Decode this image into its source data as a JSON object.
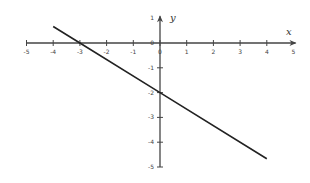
{
  "chart_data": {
    "type": "line",
    "title": "",
    "xlabel": "x",
    "ylabel": "y",
    "xlim": [
      -5,
      5
    ],
    "ylim": [
      -5,
      1
    ],
    "x_ticks": [
      -5,
      -4,
      -3,
      -2,
      -1,
      0,
      1,
      2,
      3,
      4,
      5
    ],
    "y_ticks": [
      1,
      0,
      -1,
      -2,
      -3,
      -4,
      -5
    ],
    "grid": false,
    "legend": null,
    "series": [
      {
        "name": "y = -2/3 x - 2",
        "x": [
          -4,
          -3,
          0,
          4
        ],
        "y": [
          0.667,
          0,
          -2,
          -4.667
        ]
      }
    ],
    "colors": {
      "line": "#222222",
      "axis": "#444444"
    }
  },
  "labels": {
    "x_axis": "x",
    "y_axis": "y",
    "x_ticks": [
      "-5",
      "-4",
      "-3",
      "-2",
      "-1",
      "0",
      "1",
      "2",
      "3",
      "4",
      "5"
    ],
    "y_ticks": [
      "1",
      "0",
      "-1",
      "-2",
      "-3",
      "-4",
      "-5"
    ]
  }
}
